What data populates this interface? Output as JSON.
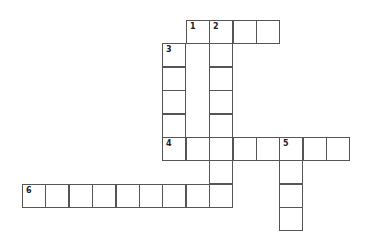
{
  "puzzle": {
    "type": "crossword",
    "cell_size": 23.4,
    "origin": {
      "x": 22,
      "y": 20
    },
    "cells": [
      {
        "col": 7,
        "row": 0,
        "num": "1"
      },
      {
        "col": 8,
        "row": 0,
        "num": "2"
      },
      {
        "col": 9,
        "row": 0
      },
      {
        "col": 10,
        "row": 0
      },
      {
        "col": 6,
        "row": 1,
        "num": "3"
      },
      {
        "col": 8,
        "row": 1
      },
      {
        "col": 6,
        "row": 2
      },
      {
        "col": 8,
        "row": 2
      },
      {
        "col": 6,
        "row": 3
      },
      {
        "col": 8,
        "row": 3
      },
      {
        "col": 6,
        "row": 4
      },
      {
        "col": 8,
        "row": 4
      },
      {
        "col": 6,
        "row": 5,
        "num": "4"
      },
      {
        "col": 7,
        "row": 5
      },
      {
        "col": 8,
        "row": 5
      },
      {
        "col": 9,
        "row": 5
      },
      {
        "col": 10,
        "row": 5
      },
      {
        "col": 11,
        "row": 5,
        "num": "5"
      },
      {
        "col": 12,
        "row": 5
      },
      {
        "col": 13,
        "row": 5
      },
      {
        "col": 8,
        "row": 6
      },
      {
        "col": 11,
        "row": 6
      },
      {
        "col": 0,
        "row": 7,
        "num": "6"
      },
      {
        "col": 1,
        "row": 7
      },
      {
        "col": 2,
        "row": 7
      },
      {
        "col": 3,
        "row": 7
      },
      {
        "col": 4,
        "row": 7
      },
      {
        "col": 5,
        "row": 7
      },
      {
        "col": 6,
        "row": 7
      },
      {
        "col": 7,
        "row": 7
      },
      {
        "col": 8,
        "row": 7
      },
      {
        "col": 11,
        "row": 7
      },
      {
        "col": 11,
        "row": 8
      }
    ],
    "words": [
      {
        "num": "1",
        "direction": "across",
        "length": 4
      },
      {
        "num": "2",
        "direction": "down",
        "length": 8
      },
      {
        "num": "3",
        "direction": "down",
        "length": 5
      },
      {
        "num": "4",
        "direction": "across",
        "length": 8
      },
      {
        "num": "5",
        "direction": "down",
        "length": 4
      },
      {
        "num": "6",
        "direction": "across",
        "length": 9
      }
    ],
    "colors": {
      "border": "#555555",
      "background": "#ffffff",
      "number": "#222222"
    }
  }
}
